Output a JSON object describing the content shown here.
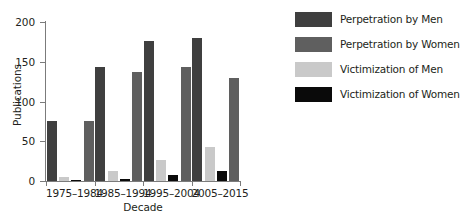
{
  "chart_data": {
    "type": "bar",
    "title": "",
    "xlabel": "Decade",
    "ylabel": "Publications",
    "categories": [
      "1975–1984",
      "1985–1994",
      "1995–2004",
      "2005–2015"
    ],
    "ylim": [
      0,
      200
    ],
    "yticks": [
      0,
      50,
      100,
      150,
      200
    ],
    "grid": false,
    "legend_position": "right",
    "series": [
      {
        "name": "Perpetration by Men",
        "color": "#3f3f3f",
        "values": [
          75,
          144,
          176,
          180
        ]
      },
      {
        "name": "Perpetration by Women",
        "color": "#5f5f5f",
        "values": [
          75,
          137,
          143,
          130
        ]
      },
      {
        "name": "Victimization of Men",
        "color": "#c9c9c9",
        "values": [
          5,
          12,
          26,
          43
        ]
      },
      {
        "name": "Victimization of Women",
        "color": "#0a0a0a",
        "values": [
          1,
          3,
          8,
          12
        ]
      }
    ]
  },
  "axes": {
    "y_title": "Publications",
    "x_title": "Decade",
    "y_tick_labels": [
      "0",
      "50",
      "100",
      "150",
      "200"
    ],
    "x_tick_labels": [
      "1975–1984",
      "1985–1994",
      "1995–2004",
      "2005–2015"
    ]
  },
  "legend": {
    "items": [
      {
        "label": "Perpetration by Men",
        "color": "#3f3f3f",
        "swatch": "swatch-dark-gray"
      },
      {
        "label": "Perpetration by Women",
        "color": "#5f5f5f",
        "swatch": "swatch-medium-gray"
      },
      {
        "label": "Victimization of Men",
        "color": "#c9c9c9",
        "swatch": "swatch-light-gray"
      },
      {
        "label": "Victimization of Women",
        "color": "#0a0a0a",
        "swatch": "swatch-black"
      }
    ]
  },
  "style": {
    "axis_color": "#7b7b7b",
    "text_color": "#231f20",
    "background": "#ffffff"
  }
}
